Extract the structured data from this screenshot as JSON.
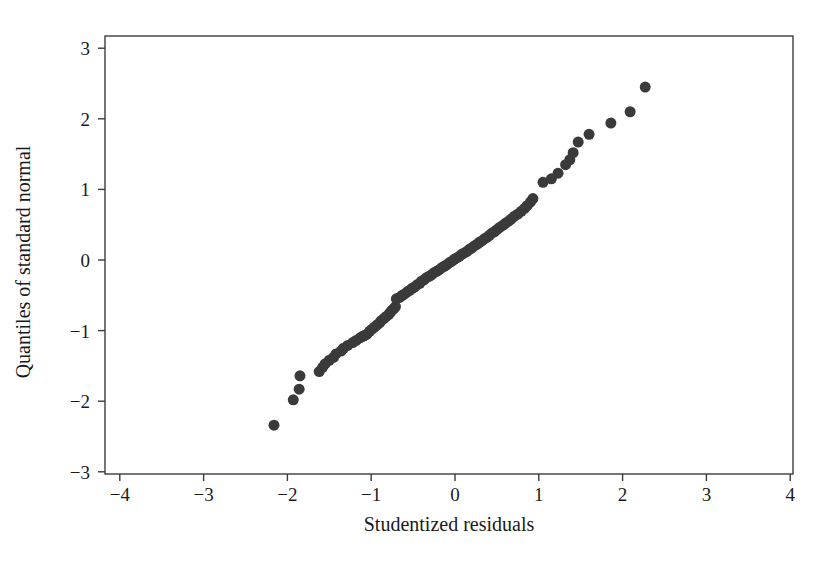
{
  "chart_data": {
    "type": "scatter",
    "title": "",
    "xlabel": "Studentized residuals",
    "ylabel": "Quantiles of standard normal",
    "xlim": [
      -4,
      4
    ],
    "ylim": [
      -3,
      3
    ],
    "xticks": [
      -4,
      -3,
      -2,
      -1,
      0,
      1,
      2,
      3,
      4
    ],
    "yticks": [
      -3,
      -2,
      -1,
      0,
      1,
      2,
      3
    ],
    "xtick_labels": [
      "−4",
      "−3",
      "−2",
      "−1",
      "0",
      "1",
      "2",
      "3",
      "4"
    ],
    "ytick_labels": [
      "−3",
      "−2",
      "−1",
      "0",
      "1",
      "2",
      "3"
    ],
    "grid": false,
    "legend": null,
    "marker": {
      "shape": "circle",
      "color": "#3a3a3a",
      "size_px": 11
    },
    "n_points": 95,
    "x": [
      -2.16,
      -1.93,
      -1.86,
      -1.85,
      -1.62,
      -1.58,
      -1.55,
      -1.5,
      -1.45,
      -1.42,
      -1.36,
      -1.33,
      -1.28,
      -1.22,
      -1.18,
      -1.13,
      -1.1,
      -1.08,
      -1.05,
      -1.02,
      -0.99,
      -0.96,
      -0.93,
      -0.9,
      -0.88,
      -0.85,
      -0.82,
      -0.79,
      -0.77,
      -0.75,
      -0.73,
      -0.71,
      -0.7,
      -0.66,
      -0.63,
      -0.6,
      -0.57,
      -0.54,
      -0.51,
      -0.48,
      -0.45,
      -0.42,
      -0.4,
      -0.37,
      -0.34,
      -0.31,
      -0.28,
      -0.25,
      -0.22,
      -0.19,
      -0.16,
      -0.13,
      -0.1,
      -0.07,
      -0.04,
      -0.01,
      0.02,
      0.05,
      0.08,
      0.11,
      0.14,
      0.17,
      0.2,
      0.23,
      0.26,
      0.29,
      0.32,
      0.35,
      0.38,
      0.41,
      0.44,
      0.47,
      0.5,
      0.53,
      0.57,
      0.6,
      0.64,
      0.67,
      0.71,
      0.75,
      0.79,
      0.83,
      0.86,
      0.9,
      0.93,
      1.05,
      1.15,
      1.23,
      1.32,
      1.37,
      1.41,
      1.47,
      1.6,
      1.86,
      2.09
    ],
    "y": [
      -2.34,
      -1.98,
      -1.83,
      -1.64,
      -1.58,
      -1.52,
      -1.47,
      -1.42,
      -1.38,
      -1.33,
      -1.29,
      -1.25,
      -1.21,
      -1.17,
      -1.14,
      -1.1,
      -1.08,
      -1.07,
      -1.05,
      -1.01,
      -0.98,
      -0.95,
      -0.92,
      -0.89,
      -0.86,
      -0.83,
      -0.8,
      -0.77,
      -0.74,
      -0.71,
      -0.69,
      -0.66,
      -0.55,
      -0.53,
      -0.5,
      -0.48,
      -0.45,
      -0.43,
      -0.4,
      -0.38,
      -0.35,
      -0.33,
      -0.3,
      -0.28,
      -0.25,
      -0.23,
      -0.21,
      -0.18,
      -0.16,
      -0.14,
      -0.11,
      -0.09,
      -0.07,
      -0.04,
      -0.02,
      0.01,
      0.03,
      0.05,
      0.08,
      0.1,
      0.12,
      0.15,
      0.17,
      0.2,
      0.22,
      0.25,
      0.27,
      0.3,
      0.32,
      0.35,
      0.38,
      0.4,
      0.43,
      0.46,
      0.49,
      0.52,
      0.55,
      0.58,
      0.62,
      0.65,
      0.69,
      0.73,
      0.77,
      0.82,
      0.87,
      1.1,
      1.15,
      1.23,
      1.35,
      1.42,
      1.52,
      1.67,
      1.78,
      1.94,
      2.1
    ],
    "extra_points": [
      {
        "x": 2.27,
        "y": 2.45
      }
    ],
    "geometry": {
      "frame_left_px": 105,
      "frame_right_px": 793,
      "frame_top_px": 36,
      "frame_bottom_px": 474,
      "x_zero_px": 455,
      "y_zero_px": 260,
      "px_per_x_unit": 83.8,
      "px_per_y_unit": 70.6,
      "tick_length_px": 7,
      "xlabel_y_px": 531,
      "ylabel_center_x_px": 30,
      "ylabel_center_y_px": 262
    }
  }
}
